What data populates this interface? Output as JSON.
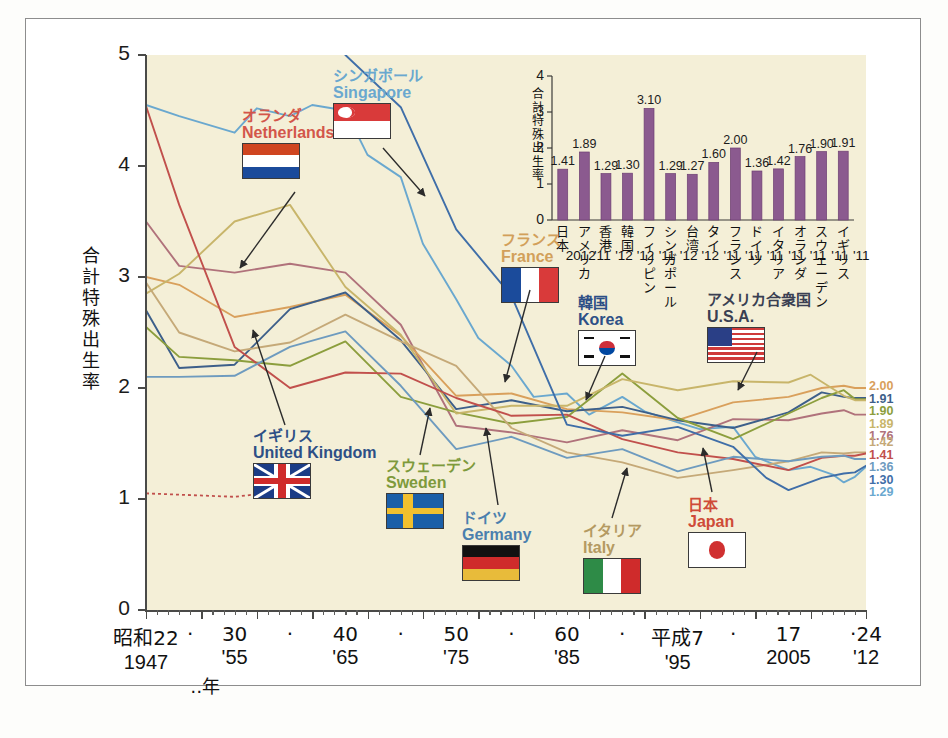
{
  "chart_data": [
    {
      "type": "line",
      "title": "",
      "xlabel": "年",
      "ylabel": "合計特殊出生率",
      "ylim": [
        0,
        5
      ],
      "xlim": [
        1947,
        2012
      ],
      "yticks": [
        0,
        1,
        2,
        3,
        4,
        5
      ],
      "grid": false,
      "legend_position": "inline-callouts",
      "x_tick_labels": [
        {
          "era": "昭和22",
          "west": "1947",
          "x": 1947
        },
        {
          "era": "·",
          "west": "",
          "x": 1951
        },
        {
          "era": "30",
          "west": "'55",
          "x": 1955
        },
        {
          "era": "·",
          "west": "",
          "x": 1960
        },
        {
          "era": "40",
          "west": "'65",
          "x": 1965
        },
        {
          "era": "·",
          "west": "",
          "x": 1970
        },
        {
          "era": "50",
          "west": "'75",
          "x": 1975
        },
        {
          "era": "·",
          "west": "",
          "x": 1980
        },
        {
          "era": "60",
          "west": "'85",
          "x": 1985
        },
        {
          "era": "·",
          "west": "",
          "x": 1990
        },
        {
          "era": "平成7",
          "west": "'95",
          "x": 1995
        },
        {
          "era": "·",
          "west": "",
          "x": 2000
        },
        {
          "era": "17",
          "west": "2005",
          "x": 2005
        },
        {
          "era": "·24",
          "west": "'12",
          "x": 2012
        }
      ],
      "series": [
        {
          "name": "Singapore",
          "name_jp": "シンガポール",
          "color": "#6aa8cf",
          "end_value": 1.29,
          "x": [
            1947,
            1950,
            1955,
            1957,
            1960,
            1962,
            1965,
            1967,
            1970,
            1972,
            1975,
            1977,
            1980,
            1982,
            1985,
            1987,
            1990,
            1992,
            1995,
            1997,
            2000,
            2002,
            2005,
            2007,
            2009,
            2010,
            2011,
            2012
          ],
          "y": [
            4.55,
            4.45,
            4.3,
            4.52,
            4.45,
            4.55,
            4.5,
            4.1,
            3.9,
            3.3,
            2.8,
            2.45,
            2.2,
            1.92,
            1.95,
            1.76,
            1.92,
            1.79,
            1.69,
            1.63,
            1.65,
            1.38,
            1.26,
            1.29,
            1.22,
            1.15,
            1.2,
            1.29
          ]
        },
        {
          "name": "Netherlands",
          "name_jp": "オランダ",
          "color": "#b0727b",
          "end_value": 1.76,
          "x": [
            1947,
            1950,
            1955,
            1960,
            1965,
            1970,
            1975,
            1980,
            1985,
            1990,
            1995,
            2000,
            2005,
            2008,
            2010,
            2011,
            2012
          ],
          "y": [
            3.5,
            3.1,
            3.04,
            3.12,
            3.04,
            2.57,
            1.66,
            1.6,
            1.51,
            1.62,
            1.53,
            1.72,
            1.71,
            1.77,
            1.8,
            1.76,
            1.76
          ]
        },
        {
          "name": "France",
          "name_jp": "フランス",
          "color": "#d9a05c",
          "end_value": 2.0,
          "x": [
            1947,
            1950,
            1955,
            1960,
            1965,
            1970,
            1975,
            1980,
            1985,
            1990,
            1995,
            2000,
            2005,
            2008,
            2010,
            2011,
            2012
          ],
          "y": [
            3.0,
            2.93,
            2.64,
            2.73,
            2.84,
            2.47,
            1.93,
            1.95,
            1.81,
            1.78,
            1.71,
            1.87,
            1.92,
            2.0,
            2.02,
            2.0,
            2.0
          ]
        },
        {
          "name": "United Kingdom",
          "name_jp": "イギリス",
          "color": "#3d5f8a",
          "end_value": 1.91,
          "x": [
            1947,
            1950,
            1955,
            1960,
            1965,
            1970,
            1975,
            1980,
            1985,
            1990,
            1995,
            2000,
            2005,
            2008,
            2010,
            2011,
            2012
          ],
          "y": [
            2.7,
            2.18,
            2.21,
            2.71,
            2.86,
            2.43,
            1.81,
            1.89,
            1.79,
            1.83,
            1.71,
            1.64,
            1.78,
            1.96,
            1.92,
            1.91,
            1.91
          ]
        },
        {
          "name": "Sweden",
          "name_jp": "スウェーデン",
          "color": "#8c9e3d",
          "end_value": 1.9,
          "x": [
            1947,
            1950,
            1955,
            1960,
            1965,
            1970,
            1975,
            1980,
            1985,
            1990,
            1995,
            2000,
            2005,
            2008,
            2010,
            2011,
            2012
          ],
          "y": [
            2.55,
            2.28,
            2.25,
            2.2,
            2.42,
            1.92,
            1.78,
            1.68,
            1.74,
            2.13,
            1.73,
            1.54,
            1.77,
            1.91,
            1.98,
            1.9,
            1.9
          ]
        },
        {
          "name": "U.S.A.",
          "name_jp": "アメリカ合衆国",
          "color": "#c8b56a",
          "end_value": 1.89,
          "x": [
            1947,
            1950,
            1955,
            1960,
            1965,
            1970,
            1975,
            1980,
            1985,
            1990,
            1995,
            2000,
            2005,
            2007,
            2010,
            2011,
            2012
          ],
          "y": [
            2.85,
            3.03,
            3.5,
            3.65,
            2.91,
            2.48,
            1.77,
            1.84,
            1.84,
            2.08,
            1.98,
            2.06,
            2.05,
            2.12,
            1.93,
            1.89,
            1.89
          ]
        },
        {
          "name": "Italy",
          "name_jp": "イタリア",
          "color": "#c5a978",
          "end_value": 1.42,
          "x": [
            1947,
            1950,
            1955,
            1960,
            1965,
            1970,
            1975,
            1980,
            1985,
            1990,
            1995,
            2000,
            2005,
            2008,
            2010,
            2011,
            2012
          ],
          "y": [
            2.95,
            2.5,
            2.33,
            2.41,
            2.66,
            2.42,
            2.2,
            1.64,
            1.42,
            1.33,
            1.19,
            1.26,
            1.34,
            1.42,
            1.41,
            1.42,
            1.42
          ]
        },
        {
          "name": "Japan",
          "name_jp": "日本",
          "color": "#c1504c",
          "end_value": 1.41,
          "x": [
            1947,
            1950,
            1955,
            1960,
            1965,
            1970,
            1975,
            1980,
            1985,
            1990,
            1995,
            2000,
            2005,
            2008,
            2010,
            2011,
            2012
          ],
          "y": [
            4.54,
            3.65,
            2.37,
            2.0,
            2.14,
            2.13,
            1.91,
            1.75,
            1.76,
            1.54,
            1.42,
            1.36,
            1.26,
            1.37,
            1.39,
            1.39,
            1.41
          ]
        },
        {
          "name": "Germany",
          "name_jp": "ドイツ",
          "color": "#6e9bbf",
          "end_value": 1.36,
          "x": [
            1947,
            1950,
            1955,
            1960,
            1965,
            1970,
            1975,
            1980,
            1985,
            1990,
            1995,
            2000,
            2005,
            2008,
            2010,
            2011,
            2012
          ],
          "y": [
            2.1,
            2.1,
            2.11,
            2.37,
            2.51,
            2.02,
            1.45,
            1.56,
            1.37,
            1.45,
            1.25,
            1.38,
            1.34,
            1.38,
            1.39,
            1.36,
            1.36
          ]
        },
        {
          "name": "Korea",
          "name_jp": "韓国",
          "color": "#3f6ea8",
          "end_value": 1.3,
          "x": [
            1960,
            1965,
            1970,
            1975,
            1980,
            1985,
            1990,
            1995,
            2000,
            2003,
            2005,
            2008,
            2010,
            2011,
            2012
          ],
          "y": [
            6.0,
            5.0,
            4.53,
            3.43,
            2.83,
            1.67,
            1.57,
            1.65,
            1.47,
            1.19,
            1.08,
            1.19,
            1.23,
            1.24,
            1.3
          ]
        }
      ],
      "end_labels_upper": [
        {
          "value": "2.00",
          "color": "#d9a05c"
        },
        {
          "value": "1.91",
          "color": "#3d5f8a"
        },
        {
          "value": "1.90",
          "color": "#8c9e3d"
        },
        {
          "value": "1.89",
          "color": "#c8b56a"
        },
        {
          "value": "1.76",
          "color": "#b0727b"
        }
      ],
      "end_labels_lower": [
        {
          "value": "1.42",
          "color": "#c5a978"
        },
        {
          "value": "1.41",
          "color": "#c1504c"
        },
        {
          "value": "1.36",
          "color": "#6e9bbf"
        },
        {
          "value": "1.30",
          "color": "#3f6ea8"
        },
        {
          "value": "1.29",
          "color": "#6aa8cf"
        }
      ]
    },
    {
      "type": "bar",
      "title": "",
      "ylabel": "合計特殊出生率",
      "ylim": [
        0,
        4
      ],
      "yticks": [
        0,
        1,
        2,
        3,
        4
      ],
      "grid": false,
      "bar_color": "#8b5a8f",
      "categories": [
        "日本",
        "アメリカ",
        "香港",
        "韓国",
        "フィリピン",
        "シンガポール",
        "台湾",
        "タイ",
        "フランス",
        "ドイツ",
        "イタリア",
        "オランダ",
        "スウェーデン",
        "イギリス"
      ],
      "values": [
        1.41,
        1.89,
        1.29,
        1.3,
        3.1,
        1.29,
        1.27,
        1.6,
        2.0,
        1.36,
        1.42,
        1.76,
        1.9,
        1.91
      ],
      "value_labels": [
        "1.41",
        "1.89",
        "1.29",
        "1.30",
        "3.10",
        "1.29",
        "1.27",
        "1.60",
        "2.00",
        "1.36",
        "1.42",
        "1.76",
        "1.90",
        "1.91"
      ],
      "years": [
        "2012",
        "'11",
        "'12",
        "'12",
        "'11",
        "'12",
        "'12",
        "'11",
        "'11",
        "'11",
        "'11",
        "'11",
        "'11",
        "'11"
      ]
    }
  ],
  "callouts": [
    {
      "id": "netherlands",
      "jp": "オランダ",
      "en": "Netherlands",
      "color": "#d3564a",
      "flag": "nl"
    },
    {
      "id": "singapore",
      "jp": "シンガポール",
      "en": "Singapore",
      "color": "#6aa8cf",
      "flag": "sg"
    },
    {
      "id": "france",
      "jp": "フランス",
      "en": "France",
      "color": "#d2a05a",
      "flag": "fr"
    },
    {
      "id": "korea",
      "jp": "韓国",
      "en": "Korea",
      "color": "#2d4f86",
      "flag": "kr"
    },
    {
      "id": "usa",
      "jp": "アメリカ合衆国",
      "en": "U.S.A.",
      "color": "#3a3f52",
      "flag": "us"
    },
    {
      "id": "uk",
      "jp": "イギリス",
      "en": "United Kingdom",
      "color": "#2d4f86",
      "flag": "gb"
    },
    {
      "id": "sweden",
      "jp": "スウェーデン",
      "en": "Sweden",
      "color": "#7e9a3c",
      "flag": "se"
    },
    {
      "id": "germany",
      "jp": "ドイツ",
      "en": "Germany",
      "color": "#4a7fae",
      "flag": "de"
    },
    {
      "id": "italy",
      "jp": "イタリア",
      "en": "Italy",
      "color": "#b49a62",
      "flag": "it"
    },
    {
      "id": "japan",
      "jp": "日本",
      "en": "Japan",
      "color": "#cf4b38",
      "flag": "jp"
    }
  ],
  "axis": {
    "y_caption": "合計特殊出生率",
    "x_caption": "年",
    "x_caption_dots": "‥",
    "y_tick_labels": [
      "5",
      "4",
      "3",
      "2",
      "1",
      "0"
    ]
  },
  "inset": {
    "y_caption": "合計特殊出生率",
    "y_tick_labels": [
      "4",
      "3",
      "2",
      "1",
      "0"
    ]
  }
}
